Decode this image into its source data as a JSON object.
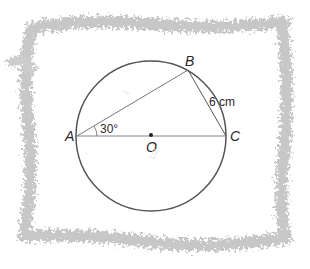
{
  "diagram": {
    "title": "",
    "type": "circle-geometry",
    "points": {
      "A": {
        "label": "A"
      },
      "B": {
        "label": "B"
      },
      "C": {
        "label": "C"
      },
      "O": {
        "label": "O"
      }
    },
    "angle_label": "30°",
    "side_label": "6 cm",
    "watermark": [
      "1",
      "1/2"
    ],
    "colors": {
      "line": "#555555",
      "text": "#2a2a2a",
      "border": "#b8b8b8",
      "background": "#ffffff"
    }
  }
}
